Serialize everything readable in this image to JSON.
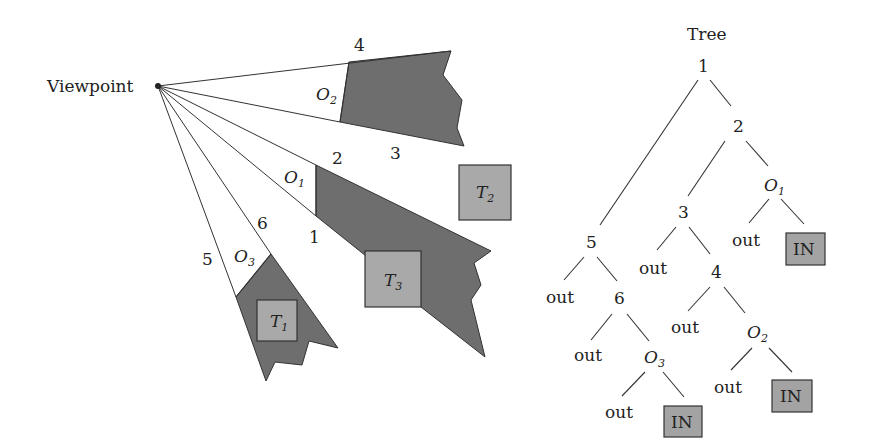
{
  "scene": {
    "viewpoint_label": "Viewpoint",
    "ray_labels": [
      "1",
      "2",
      "3",
      "4",
      "5",
      "6"
    ],
    "occluders": [
      {
        "name": "O",
        "sub": "1"
      },
      {
        "name": "O",
        "sub": "2"
      },
      {
        "name": "O",
        "sub": "3"
      }
    ],
    "targets": [
      {
        "name": "T",
        "sub": "1"
      },
      {
        "name": "T",
        "sub": "2"
      },
      {
        "name": "T",
        "sub": "3"
      }
    ]
  },
  "tree": {
    "title": "Tree",
    "nodes": {
      "n1": "1",
      "n2": "2",
      "n3": "3",
      "n4": "4",
      "n5": "5",
      "n6": "6",
      "o1": {
        "name": "O",
        "sub": "1"
      },
      "o2": {
        "name": "O",
        "sub": "2"
      },
      "o3": {
        "name": "O",
        "sub": "3"
      },
      "out_label": "out",
      "in_label": "IN"
    }
  },
  "colors": {
    "shadow": "#6e6e6e",
    "target": "#a9a9a9",
    "in_box": "#a3a3a3",
    "line": "#333333"
  }
}
